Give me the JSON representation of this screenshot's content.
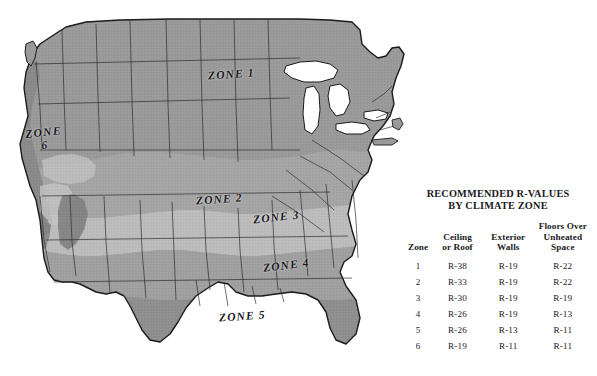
{
  "map": {
    "title_alt": "United States climate zone map",
    "zone_labels": [
      {
        "id": "1",
        "text": "ZONE 1"
      },
      {
        "id": "6",
        "text": "ZONE",
        "text2": "6"
      },
      {
        "id": "2",
        "text": "ZONE 2"
      },
      {
        "id": "3",
        "text": "ZONE 3"
      },
      {
        "id": "4",
        "text": "ZONE 4"
      },
      {
        "id": "5",
        "text": "ZONE 5"
      }
    ],
    "colors": {
      "background": "#ffffff",
      "zone1": "#9a9a9a",
      "zone2": "#a5a5a5",
      "zone3": "#bcbcbc",
      "zone4": "#a0a0a0",
      "zone5": "#8f8f8f",
      "zone6": "#8a8a8a",
      "lake": "#ffffff",
      "outline": "#1b1b1b"
    }
  },
  "panel": {
    "title_line1": "RECOMMENDED R-VALUES",
    "title_line2": "BY CLIMATE ZONE",
    "headers": {
      "zone": "Zone",
      "ceiling_l1": "Ceiling",
      "ceiling_l2": "or Roof",
      "walls_l1": "Exterior",
      "walls_l2": "Walls",
      "floors_l1": "Floors Over",
      "floors_l2": "Unheated",
      "floors_l3": "Space"
    },
    "rows": [
      {
        "zone": "1",
        "ceiling": "R-38",
        "walls": "R-19",
        "floors": "R-22"
      },
      {
        "zone": "2",
        "ceiling": "R-33",
        "walls": "R-19",
        "floors": "R-22"
      },
      {
        "zone": "3",
        "ceiling": "R-30",
        "walls": "R-19",
        "floors": "R-19"
      },
      {
        "zone": "4",
        "ceiling": "R-26",
        "walls": "R-19",
        "floors": "R-13"
      },
      {
        "zone": "5",
        "ceiling": "R-26",
        "walls": "R-13",
        "floors": "R-11"
      },
      {
        "zone": "6",
        "ceiling": "R-19",
        "walls": "R-11",
        "floors": "R-11"
      }
    ]
  }
}
